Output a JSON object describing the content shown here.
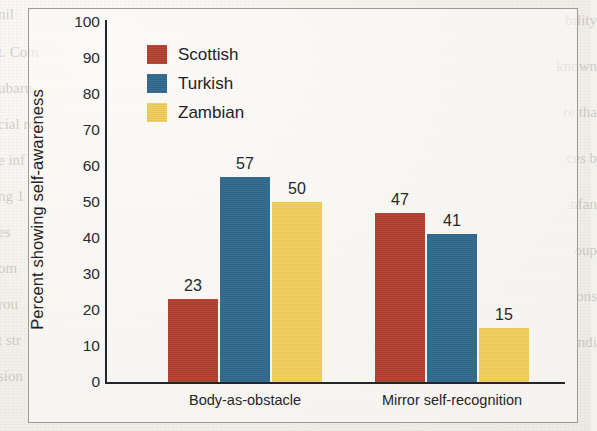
{
  "figure": {
    "background_color": "#f3f1ec",
    "frame_color": "#9d9a93"
  },
  "bleed_through": {
    "left": [
      "nil",
      "t. Com",
      "ubaru",
      "cial rec",
      "e inf",
      "ng 1",
      "es",
      "om",
      "rou",
      "t str",
      "sion"
    ],
    "right": [
      "bility",
      "known",
      "re tha",
      "ces b",
      "nfan",
      "oup",
      "ons",
      "ndi"
    ]
  },
  "chart_data": {
    "type": "bar",
    "title": "",
    "xlabel": "",
    "ylabel": "Percent showing self-awareness",
    "ylim": [
      0,
      100
    ],
    "ytick_step": 10,
    "yticks": [
      0,
      10,
      20,
      30,
      40,
      50,
      60,
      70,
      80,
      90,
      100
    ],
    "grid": false,
    "legend_position": "top-left-inside",
    "categories": [
      "Body-as-obstacle",
      "Mirror self-recognition"
    ],
    "series": [
      {
        "name": "Scottish",
        "color": "#b0402f",
        "values": [
          23,
          47
        ]
      },
      {
        "name": "Turkish",
        "color": "#30688c",
        "values": [
          57,
          41
        ]
      },
      {
        "name": "Zambian",
        "color": "#f0cd59",
        "values": [
          50,
          15
        ]
      }
    ]
  },
  "legend": {
    "items": [
      {
        "label": "Scottish",
        "color": "#b0402f"
      },
      {
        "label": "Turkish",
        "color": "#30688c"
      },
      {
        "label": "Zambian",
        "color": "#f0cd59"
      }
    ]
  }
}
